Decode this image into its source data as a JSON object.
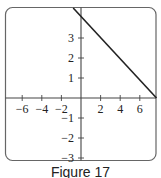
{
  "caption": "Figure 17",
  "colors": {
    "frame": "#555555",
    "axis": "#444444",
    "line": "#222222",
    "text": "#222222"
  },
  "chart_data": {
    "type": "line",
    "title": "",
    "caption": "Figure 17",
    "xlabel": "",
    "ylabel": "",
    "xlim": [
      -8.1,
      7.7
    ],
    "ylim": [
      -3.1,
      4.55
    ],
    "grid": false,
    "x_ticks": [
      -6,
      -4,
      -2,
      2,
      4,
      6
    ],
    "x_tick_labels": [
      "−6",
      "−4",
      "−2",
      "2",
      "4",
      "6"
    ],
    "y_ticks": [
      3,
      2,
      1,
      -1,
      -2,
      -3
    ],
    "y_tick_labels": [
      "3",
      "2",
      "1",
      "−1",
      "−2",
      "−3"
    ],
    "series": [
      {
        "name": "line",
        "equation": "y = 4 - 0.5x (approx.)",
        "x": [
          -0.8,
          7.7
        ],
        "y": [
          4.5,
          0.0
        ]
      }
    ],
    "legend": null
  }
}
